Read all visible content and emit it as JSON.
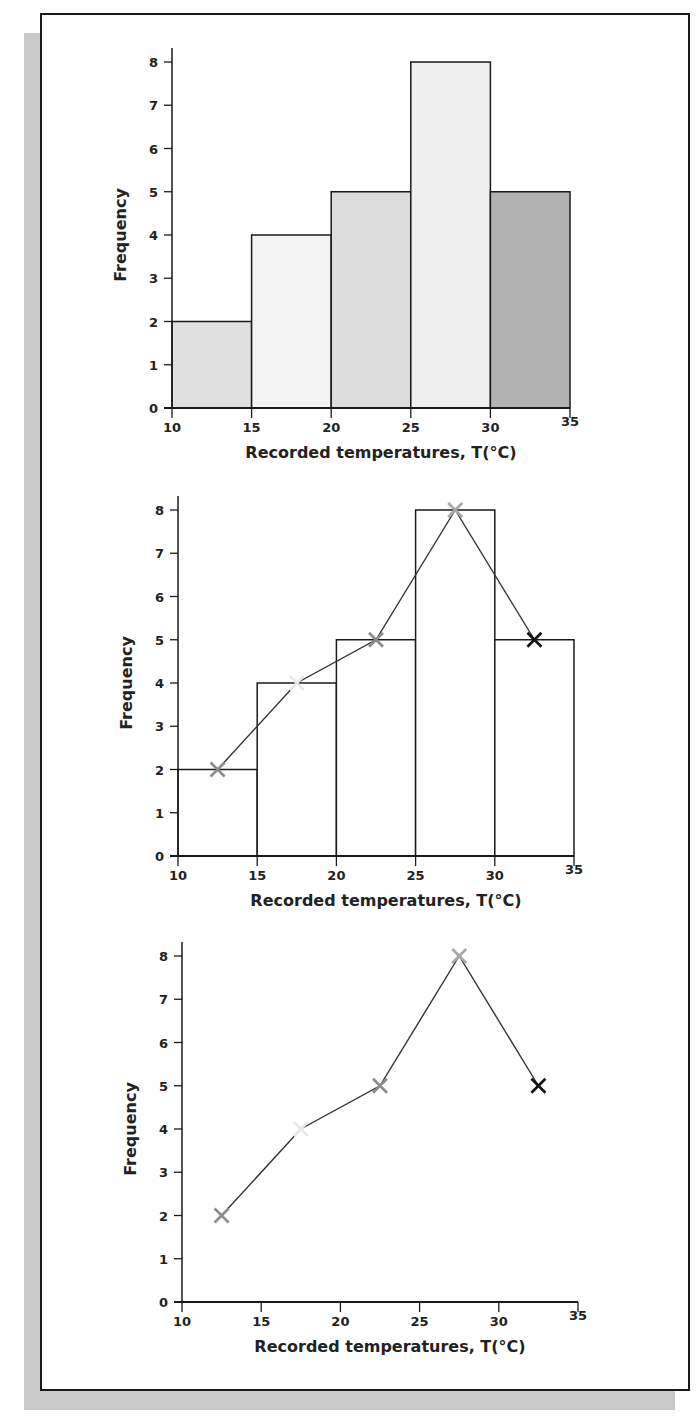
{
  "chart_data": [
    {
      "type": "bar",
      "subtype": "histogram",
      "title": "",
      "xlabel": "Recorded temperatures, T(°C)",
      "ylabel": "Frequency",
      "bins": [
        [
          10,
          15
        ],
        [
          15,
          20
        ],
        [
          20,
          25
        ],
        [
          25,
          30
        ],
        [
          30,
          35
        ]
      ],
      "categories": [
        "10-15",
        "15-20",
        "20-25",
        "25-30",
        "30-35"
      ],
      "values": [
        2,
        4,
        5,
        8,
        5
      ],
      "bar_colors": [
        "#e0e0e0",
        "#f3f3f3",
        "#dcdcdc",
        "#efefef",
        "#b2b2b2"
      ],
      "xticks": [
        10,
        15,
        20,
        25,
        30,
        35
      ],
      "yticks": [
        0,
        1,
        2,
        3,
        4,
        5,
        6,
        7,
        8
      ],
      "xlim": [
        10,
        35
      ],
      "ylim": [
        0,
        8
      ],
      "grid": false
    },
    {
      "type": "bar",
      "subtype": "histogram-with-frequency-polygon",
      "title": "",
      "xlabel": "Recorded temperatures, T(°C)",
      "ylabel": "Frequency",
      "bins": [
        [
          10,
          15
        ],
        [
          15,
          20
        ],
        [
          20,
          25
        ],
        [
          25,
          30
        ],
        [
          30,
          35
        ]
      ],
      "categories": [
        "10-15",
        "15-20",
        "20-25",
        "25-30",
        "30-35"
      ],
      "values": [
        2,
        4,
        5,
        8,
        5
      ],
      "bar_colors": [
        "#ffffff",
        "#ffffff",
        "#ffffff",
        "#ffffff",
        "#ffffff"
      ],
      "series": [
        {
          "name": "frequency polygon",
          "type": "line",
          "x": [
            12.5,
            17.5,
            22.5,
            27.5,
            32.5
          ],
          "values": [
            2,
            4,
            5,
            8,
            5
          ],
          "marker": "x",
          "marker_colors": [
            "#8c8c8c",
            "#e8e8e8",
            "#8c8c8c",
            "#a8a8a8",
            "#111111"
          ]
        }
      ],
      "xticks": [
        10,
        15,
        20,
        25,
        30,
        35
      ],
      "yticks": [
        0,
        1,
        2,
        3,
        4,
        5,
        6,
        7,
        8
      ],
      "xlim": [
        10,
        35
      ],
      "ylim": [
        0,
        8
      ],
      "grid": false
    },
    {
      "type": "line",
      "subtype": "frequency-polygon",
      "title": "",
      "xlabel": "Recorded temperatures, T(°C)",
      "ylabel": "Frequency",
      "x": [
        12.5,
        17.5,
        22.5,
        27.5,
        32.5
      ],
      "series": [
        {
          "name": "frequency polygon",
          "values": [
            2,
            4,
            5,
            8,
            5
          ],
          "marker": "x",
          "marker_colors": [
            "#8c8c8c",
            "#e8e8e8",
            "#8c8c8c",
            "#a8a8a8",
            "#111111"
          ]
        }
      ],
      "xticks": [
        10,
        15,
        20,
        25,
        30,
        35
      ],
      "yticks": [
        0,
        1,
        2,
        3,
        4,
        5,
        6,
        7,
        8
      ],
      "xlim": [
        10,
        35
      ],
      "ylim": [
        0,
        8
      ],
      "grid": false
    }
  ],
  "layout": {
    "charts": [
      {
        "x0": 172,
        "x1": 570,
        "y0": 408,
        "y8": 62
      },
      {
        "x0": 178,
        "x1": 574,
        "y0": 856,
        "y8": 510
      },
      {
        "x0": 182,
        "x1": 578,
        "y0": 1302,
        "y8": 956
      }
    ],
    "line_color": "#1a1a1a"
  }
}
